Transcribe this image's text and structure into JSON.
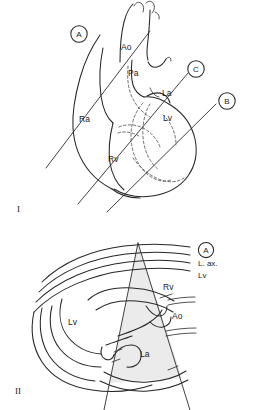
{
  "figure": {
    "background_color": "#ffffff",
    "line_color": "#262626"
  },
  "panels": [
    {
      "id": "panel-1",
      "numeral": "I",
      "caption": "Anterior view of heart with scan plane lines A, B and C",
      "plane_markers": [
        {
          "id": "marker-a",
          "label": "A"
        },
        {
          "id": "marker-b",
          "label": "B"
        },
        {
          "id": "marker-c",
          "label": "C"
        }
      ],
      "structure_labels": [
        {
          "id": "label-ao",
          "text": "Ao",
          "meaning": "aorta"
        },
        {
          "id": "label-pa",
          "text": "Pa",
          "meaning": "pulmonary artery"
        },
        {
          "id": "label-la",
          "text": "La",
          "meaning": "left atrium"
        },
        {
          "id": "label-lv",
          "text": "Lv",
          "meaning": "left ventricle"
        },
        {
          "id": "label-ra",
          "text": "Ra",
          "meaning": "right atrium"
        },
        {
          "id": "label-rv",
          "text": "Rv",
          "meaning": "right ventricle"
        }
      ]
    },
    {
      "id": "panel-2",
      "numeral": "II",
      "caption": "Long axis sector scan corresponding to plane A",
      "legend": {
        "marker": "A",
        "lines": [
          "L. ax.",
          "Lv"
        ]
      },
      "structure_labels": [
        {
          "id": "label-rv-2",
          "text": "Rv",
          "meaning": "right ventricle"
        },
        {
          "id": "label-ao-2",
          "text": "Ao",
          "meaning": "aorta"
        },
        {
          "id": "label-lv-2",
          "text": "Lv",
          "meaning": "left ventricle"
        },
        {
          "id": "label-la-2",
          "text": "La",
          "meaning": "left atrium"
        }
      ]
    }
  ]
}
